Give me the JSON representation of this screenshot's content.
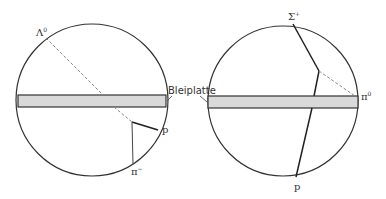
{
  "diagram": {
    "plate_label": "Bleiplatte",
    "colors": {
      "stroke": "#333333",
      "plate_fill": "#d9d9d9",
      "dash": "#888888"
    },
    "left": {
      "particles": [
        {
          "name": "Lambda0",
          "symbol": "Λ",
          "charge": "0"
        },
        {
          "name": "proton",
          "symbol": "p",
          "charge": ""
        },
        {
          "name": "pi-minus",
          "symbol": "π",
          "charge": "−"
        }
      ]
    },
    "right": {
      "particles": [
        {
          "name": "Sigma+",
          "symbol": "Σ",
          "charge": "+"
        },
        {
          "name": "pi0",
          "symbol": "π",
          "charge": "0"
        },
        {
          "name": "proton",
          "symbol": "p",
          "charge": ""
        }
      ]
    }
  }
}
